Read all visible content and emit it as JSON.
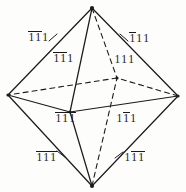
{
  "figure": {
    "name": "octahedron-miller-indices",
    "shape": "octahedron",
    "line_color": "#1c1c1c",
    "background_color": "#fdfdfc"
  },
  "vertices": [
    {
      "id": "top",
      "label": "top-vertex",
      "x": 92,
      "y": 8
    },
    {
      "id": "bottom",
      "label": "bottom-vertex",
      "x": 92,
      "y": 186
    },
    {
      "id": "left",
      "label": "left-vertex",
      "x": 8,
      "y": 95
    },
    {
      "id": "right",
      "label": "right-vertex",
      "x": 178,
      "y": 96
    },
    {
      "id": "front",
      "label": "front-vertex",
      "x": 70,
      "y": 112
    },
    {
      "id": "back",
      "label": "back-vertex",
      "x": 117,
      "y": 78
    }
  ],
  "edges": [
    {
      "from": "top",
      "to": "left",
      "style": "solid"
    },
    {
      "from": "top",
      "to": "right",
      "style": "solid"
    },
    {
      "from": "top",
      "to": "front",
      "style": "solid"
    },
    {
      "from": "top",
      "to": "back",
      "style": "dashed"
    },
    {
      "from": "bottom",
      "to": "left",
      "style": "solid"
    },
    {
      "from": "bottom",
      "to": "right",
      "style": "solid"
    },
    {
      "from": "bottom",
      "to": "front",
      "style": "solid"
    },
    {
      "from": "bottom",
      "to": "back",
      "style": "dashed"
    },
    {
      "from": "left",
      "to": "front",
      "style": "solid"
    },
    {
      "from": "front",
      "to": "right",
      "style": "solid"
    },
    {
      "from": "right",
      "to": "back",
      "style": "dashed"
    },
    {
      "from": "back",
      "to": "left",
      "style": "dashed"
    }
  ],
  "labels": [
    {
      "name": "face-label-upper-left-outer",
      "digits": [
        {
          "value": "1",
          "bar": true
        },
        {
          "value": "1",
          "bar": true
        },
        {
          "value": "1",
          "bar": false
        }
      ],
      "x": 28,
      "y": 32,
      "leader": {
        "x1": 49,
        "y1": 41,
        "x2": 57,
        "y2": 34
      }
    },
    {
      "name": "face-label-upper-left-inner",
      "digits": [
        {
          "value": "1",
          "bar": true
        },
        {
          "value": "1",
          "bar": true
        },
        {
          "value": "1",
          "bar": false
        }
      ],
      "x": 53,
      "y": 53
    },
    {
      "name": "face-label-upper-right-outer",
      "digits": [
        {
          "value": "1",
          "bar": true
        },
        {
          "value": "1",
          "bar": false
        },
        {
          "value": "1",
          "bar": false
        }
      ],
      "x": 129,
      "y": 33,
      "leader": {
        "x1": 120,
        "y1": 34,
        "x2": 128,
        "y2": 41
      }
    },
    {
      "name": "face-label-upper-right-inner",
      "digits": [
        {
          "value": "1",
          "bar": false
        },
        {
          "value": "1",
          "bar": false
        },
        {
          "value": "1",
          "bar": false
        }
      ],
      "x": 114,
      "y": 54
    },
    {
      "name": "face-label-lower-left-inner",
      "digits": [
        {
          "value": "1",
          "bar": true
        },
        {
          "value": "1",
          "bar": true
        },
        {
          "value": "1",
          "bar": true
        }
      ],
      "x": 55,
      "y": 113
    },
    {
      "name": "face-label-lower-right-inner",
      "digits": [
        {
          "value": "1",
          "bar": false
        },
        {
          "value": "1",
          "bar": true
        },
        {
          "value": "1",
          "bar": false
        }
      ],
      "x": 116,
      "y": 113
    },
    {
      "name": "face-label-lower-left-outer",
      "digits": [
        {
          "value": "1",
          "bar": true
        },
        {
          "value": "1",
          "bar": true
        },
        {
          "value": "1",
          "bar": true
        }
      ],
      "x": 36,
      "y": 152,
      "leader": {
        "x1": 57,
        "y1": 151,
        "x2": 66,
        "y2": 158
      }
    },
    {
      "name": "face-label-lower-right-outer",
      "digits": [
        {
          "value": "1",
          "bar": false
        },
        {
          "value": "1",
          "bar": true
        },
        {
          "value": "1",
          "bar": true
        }
      ],
      "x": 124,
      "y": 152,
      "leader": {
        "x1": 115,
        "y1": 158,
        "x2": 123,
        "y2": 152
      }
    }
  ]
}
